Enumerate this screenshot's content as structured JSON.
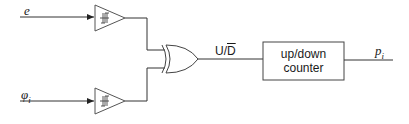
{
  "diagram": {
    "inputs": [
      {
        "name": "e",
        "symbol": "e",
        "subscript": ""
      },
      {
        "name": "phi_i",
        "symbol": "φ",
        "subscript": "i"
      }
    ],
    "components": {
      "buffer_top": {
        "type": "schmitt-trigger-buffer",
        "icon": "hysteresis-icon"
      },
      "buffer_bottom": {
        "type": "schmitt-trigger-buffer",
        "icon": "hysteresis-icon"
      },
      "xor_gate": {
        "type": "xor-gate"
      },
      "counter": {
        "line1": "up/down",
        "line2": "counter"
      }
    },
    "signals": {
      "xor_output": {
        "prefix": "U/",
        "overlined": "D"
      },
      "output": {
        "symbol": "p",
        "subscript": "i"
      }
    },
    "colors": {
      "stroke": "#333333",
      "background": "#ffffff"
    }
  }
}
